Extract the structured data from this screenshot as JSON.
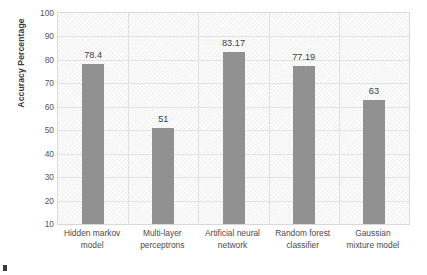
{
  "chart_data": {
    "type": "bar",
    "title": "",
    "xlabel": "",
    "ylabel": "Accuracy Percentage",
    "categories": [
      "Hidden markov model",
      "Multi-layer perceptrons",
      "Artificial neural network",
      "Random forest classifier",
      "Gaussian mixture model"
    ],
    "category_lines": [
      [
        "Hidden markov",
        "model"
      ],
      [
        "Multi-layer",
        "perceptrons"
      ],
      [
        "Artificial neural",
        "network"
      ],
      [
        "Random forest",
        "classifier"
      ],
      [
        "Gaussian",
        "mixture model"
      ]
    ],
    "values": [
      78.4,
      51,
      83.17,
      77.19,
      63
    ],
    "value_labels": [
      "78.4",
      "51",
      "83.17",
      "77.19",
      "63"
    ],
    "ylim": [
      10,
      100
    ],
    "ytick_values": [
      100,
      90,
      80,
      70,
      60,
      50,
      40,
      30,
      20,
      10
    ],
    "ytick_labels": [
      "100",
      "90",
      "80",
      "70",
      "60",
      "50",
      "40",
      "30",
      "20",
      "10"
    ],
    "grid": "horizontal-and-category-separators",
    "legend": "none",
    "bar_color": "#919191",
    "plot_background": "#ffffff",
    "grid_color": "#e3e3e3",
    "border_color": "#d9d9d9",
    "text_color": "#4a4a4a"
  }
}
